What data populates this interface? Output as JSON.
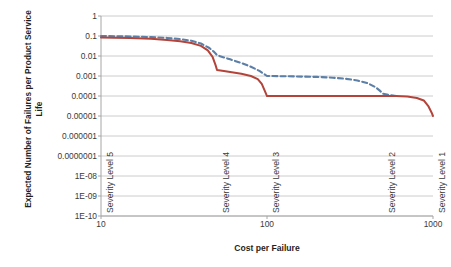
{
  "chart_data": {
    "type": "line",
    "title": "",
    "xlabel": "Cost per Failure",
    "ylabel": "Expected Number of Failures per Product Service Life",
    "xscale": "log",
    "yscale": "log",
    "xlim": [
      10,
      1000
    ],
    "ylim": [
      1e-10,
      1
    ],
    "grid": true,
    "legend": "none",
    "xticks": [
      "10",
      "100",
      "1000"
    ],
    "xtick_values": [
      10,
      100,
      1000
    ],
    "yticks": [
      "1",
      "0.1",
      "0.01",
      "0.001",
      "0.0001",
      "0.00001",
      "0.000001",
      "0.0000001",
      "1E-08",
      "1E-09",
      "1E-10"
    ],
    "ytick_values": [
      1,
      0.1,
      0.01,
      0.001,
      0.0001,
      1e-05,
      1e-06,
      1e-07,
      1e-08,
      1e-09,
      1e-10
    ],
    "annotations": [
      {
        "text": "Severity Level 5",
        "x": 10,
        "orientation": "vertical"
      },
      {
        "text": "Severity Level 4",
        "x": 50,
        "orientation": "vertical"
      },
      {
        "text": "Severity Level 3",
        "x": 100,
        "orientation": "vertical"
      },
      {
        "text": "Severity Level 2",
        "x": 500,
        "orientation": "vertical"
      },
      {
        "text": "Severity Level 1",
        "x": 1000,
        "orientation": "vertical"
      }
    ],
    "series": [
      {
        "name": "dashed-curve",
        "color": "#5B7FA6",
        "style": "dashed",
        "x": [
          10,
          12,
          15,
          20,
          25,
          30,
          35,
          40,
          45,
          48,
          50,
          55,
          60,
          70,
          80,
          90,
          100,
          120,
          150,
          200,
          250,
          300,
          350,
          400,
          450,
          480,
          500,
          550,
          600
        ],
        "y": [
          0.1,
          0.098,
          0.095,
          0.088,
          0.08,
          0.07,
          0.058,
          0.042,
          0.025,
          0.016,
          0.011,
          0.0085,
          0.0068,
          0.0045,
          0.0029,
          0.0018,
          0.001,
          0.00098,
          0.00095,
          0.0009,
          0.00082,
          0.00072,
          0.0006,
          0.00045,
          0.00028,
          0.00018,
          0.00013,
          0.00011,
          0.0001
        ]
      },
      {
        "name": "solid-curve",
        "color": "#B4443A",
        "style": "solid",
        "x": [
          10,
          12,
          15,
          20,
          25,
          30,
          35,
          40,
          44,
          47,
          49,
          50,
          55,
          60,
          70,
          80,
          88,
          93,
          97,
          99,
          100,
          150,
          250,
          400,
          500,
          600,
          700,
          800,
          880,
          940,
          980,
          1000
        ],
        "y": [
          0.085,
          0.082,
          0.079,
          0.072,
          0.064,
          0.055,
          0.045,
          0.032,
          0.019,
          0.009,
          0.0035,
          0.002,
          0.0018,
          0.0016,
          0.0013,
          0.001,
          0.0007,
          0.0004,
          0.00018,
          0.00012,
          0.0001,
          0.0001,
          0.0001,
          0.0001,
          0.0001,
          0.0001,
          9.5e-05,
          8e-05,
          6e-05,
          3e-05,
          1.5e-05,
          1e-05
        ]
      }
    ]
  }
}
